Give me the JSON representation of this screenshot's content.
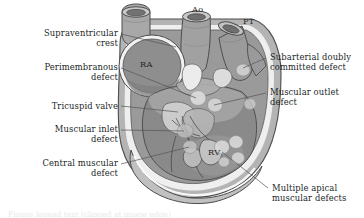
{
  "figure": {
    "colors": {
      "background": "#ffffff",
      "text": "#221f1f",
      "outline": "#4a4a4a",
      "vessel_light": "#b9b9b9",
      "vessel_mid": "#9d9d9d",
      "vessel_dark": "#868686",
      "chamber_ra": "#8e8e8e",
      "chamber_rv": "#8a8a8a",
      "myocardium": "#b4b4b4",
      "endocardium_highlight": "#f2f2f2",
      "defect_fill": "#cfcfcf",
      "valve_light": "#dedede",
      "leader_line": "#555555"
    }
  },
  "labels_left": [
    {
      "id": "supraventricular-crest",
      "text": "Supraventricular\ncrest",
      "x": 10,
      "y": 28,
      "width": 108,
      "leader": {
        "x1": 121,
        "y1": 34,
        "x2": 176,
        "y2": 47
      }
    },
    {
      "id": "perimembranous-defect",
      "text": "Perimembranous\ndefect",
      "x": 10,
      "y": 62,
      "width": 108,
      "leader": {
        "x1": 121,
        "y1": 68,
        "x2": 196,
        "y2": 98
      }
    },
    {
      "id": "tricuspid-valve",
      "text": "Tricuspid valve",
      "x": 10,
      "y": 101,
      "width": 108,
      "leader": {
        "x1": 121,
        "y1": 106,
        "x2": 178,
        "y2": 112
      }
    },
    {
      "id": "muscular-inlet-defect",
      "text": "Muscular inlet\ndefect",
      "x": 10,
      "y": 124,
      "width": 108,
      "leader": {
        "x1": 121,
        "y1": 130,
        "x2": 184,
        "y2": 131
      }
    },
    {
      "id": "central-muscular-defect",
      "text": "Central muscular\ndefect",
      "x": 10,
      "y": 158,
      "width": 108,
      "leader": {
        "x1": 121,
        "y1": 164,
        "x2": 189,
        "y2": 147
      }
    }
  ],
  "labels_right": [
    {
      "id": "subarterial-doubly-committed-defect",
      "text": "Subarterial doubly\ncommitted defect",
      "x": 270,
      "y": 52,
      "width": 92,
      "leader": {
        "x1": 266,
        "y1": 58,
        "x2": 243,
        "y2": 68
      }
    },
    {
      "id": "muscular-outlet-defect",
      "text": "Muscular outlet\ndefect",
      "x": 270,
      "y": 87,
      "width": 92,
      "leader": {
        "x1": 266,
        "y1": 93,
        "x2": 214,
        "y2": 105
      }
    },
    {
      "id": "multiple-apical-muscular-defects",
      "text": "Multiple apical\nmuscular defects",
      "x": 272,
      "y": 183,
      "width": 92,
      "leader": {
        "x1": 268,
        "y1": 188,
        "x2": 222,
        "y2": 152
      }
    }
  ],
  "inline_labels": [
    {
      "id": "aorta",
      "text": "Ao",
      "x": 192,
      "y": 4
    },
    {
      "id": "pulmonary-trunk",
      "text": "PT",
      "x": 243,
      "y": 16
    },
    {
      "id": "right-atrium",
      "text": "RA",
      "x": 140,
      "y": 59
    },
    {
      "id": "right-ventricle",
      "text": "RV",
      "x": 208,
      "y": 147
    }
  ],
  "caption_clipped": "Figure legend text (clipped at image edge)"
}
